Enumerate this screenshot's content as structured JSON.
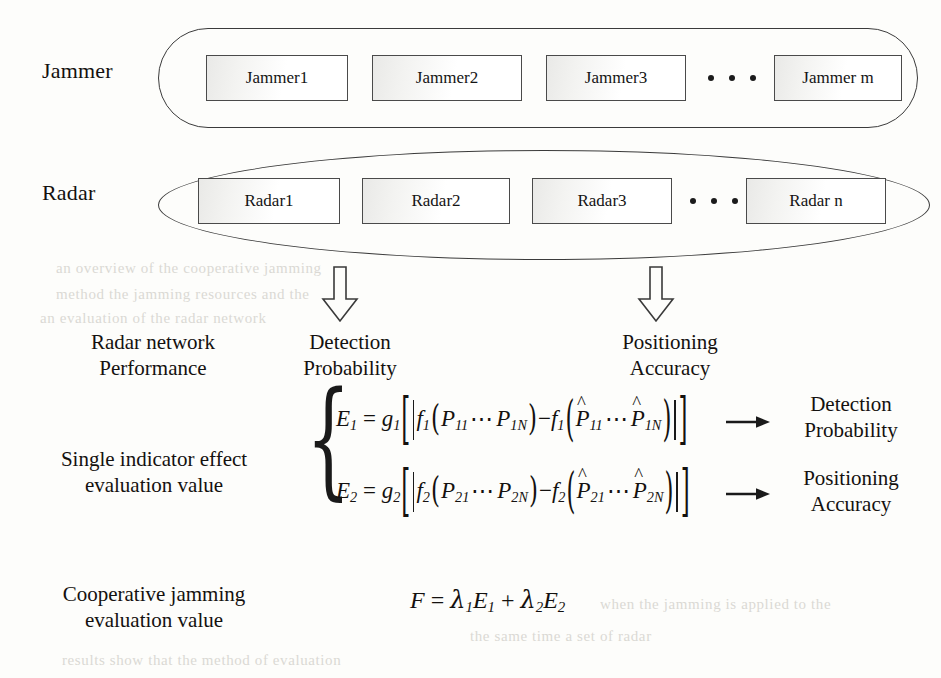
{
  "diagram": {
    "rows": [
      {
        "label": "Jammer",
        "shape": "capsule",
        "nodes": [
          "Jammer1",
          "Jammer2",
          "Jammer3",
          "Jammer m"
        ],
        "ellipsis": "• • •"
      },
      {
        "label": "Radar",
        "shape": "ellipse",
        "nodes": [
          "Radar1",
          "Radar2",
          "Radar3",
          "Radar n"
        ],
        "ellipsis": "• • •"
      }
    ],
    "arrows": {
      "down_left": "down-block-arrow",
      "down_right": "down-block-arrow",
      "right_top": "right-arrow",
      "right_bottom": "right-arrow"
    },
    "left_labels": {
      "performance_line1": "Radar network",
      "performance_line2": "Performance",
      "single_line1": "Single indicator effect",
      "single_line2": "evaluation value",
      "coop_line1": "Cooperative jamming",
      "coop_line2": "evaluation value"
    },
    "mid_headers": {
      "detection_line1": "Detection",
      "detection_line2": "Probability",
      "positioning_line1": "Positioning",
      "positioning_line2": "Accuracy"
    },
    "right_labels": {
      "detection_line1": "Detection",
      "detection_line2": "Probability",
      "positioning_line1": "Positioning",
      "positioning_line2": "Accuracy"
    },
    "equations": {
      "brace": "{",
      "eq1_plain": "E1 = g1[ | f1(P11 ⋯ P1N) − f1(P̂11 ⋯ P̂1N) | ]",
      "eq2_plain": "E2 = g2[ | f2(P21 ⋯ P2N) − f2(P̂21 ⋯ P̂2N) | ]",
      "final_plain": "F = λ1E1 + λ2E2",
      "eq1": {
        "lhs_var": "E",
        "lhs_sub": "1",
        "eq": "=",
        "g": "g",
        "g_sub": "1",
        "f": "f",
        "f_sub": "1",
        "p": "P",
        "p_sub_first": "11",
        "p_sub_last": "1N",
        "minus": "−",
        "cdots": "⋯",
        "hat": "^"
      },
      "eq2": {
        "lhs_var": "E",
        "lhs_sub": "2",
        "eq": "=",
        "g": "g",
        "g_sub": "2",
        "f": "f",
        "f_sub": "2",
        "p": "P",
        "p_sub_first": "21",
        "p_sub_last": "2N",
        "minus": "−",
        "cdots": "⋯",
        "hat": "^"
      },
      "final": {
        "f": "F",
        "eq": "=",
        "lambda": "λ",
        "l1_sub": "1",
        "l2_sub": "2",
        "e": "E",
        "e1_sub": "1",
        "e2_sub": "2",
        "plus": "+"
      }
    },
    "colors": {
      "ink": "#14110f",
      "line": "#3b3b3b",
      "box_border": "#4a4a4a",
      "paper": "#fdfdfb",
      "bleed": "#b9b6ae"
    },
    "bleed_text": [
      "an overview of the cooperative jamming",
      "method the jamming resources and the",
      "an evaluation of the radar network",
      "when the jamming is applied to the",
      "the same time a set of radar",
      "results show that the method of evaluation"
    ]
  }
}
